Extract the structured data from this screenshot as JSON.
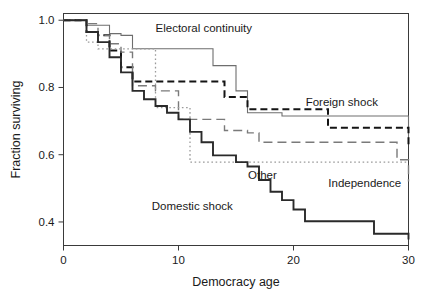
{
  "chart_data": {
    "type": "line",
    "title": "",
    "xlabel": "Democracy age",
    "ylabel": "Fraction surviving",
    "xlim": [
      0,
      30
    ],
    "ylim": [
      0.33,
      1.02
    ],
    "xticks": [
      0,
      10,
      20,
      30
    ],
    "xtick_labels": [
      "0",
      "10",
      "20",
      "30"
    ],
    "yticks": [
      0.4,
      0.6,
      0.8,
      1.0
    ],
    "ytick_labels": [
      "0.4",
      "0.6",
      "0.8",
      "1.0"
    ],
    "grid": false,
    "legend": "inline-annotations",
    "step_type": "post",
    "series": [
      {
        "name": "Electoral continuity",
        "style": "solid-thin",
        "color": "#6e6e6e",
        "label_x": 12.2,
        "label_y": 0.965,
        "x": [
          0,
          1,
          2,
          3,
          4,
          5,
          6,
          11,
          13,
          15,
          16,
          19,
          30
        ],
        "y": [
          1.0,
          1.0,
          0.985,
          0.985,
          0.96,
          0.955,
          0.915,
          0.915,
          0.865,
          0.79,
          0.725,
          0.715,
          0.645
        ]
      },
      {
        "name": "Foreign shock",
        "style": "dashed-bold",
        "color": "#141414",
        "label_x": 24.2,
        "label_y": 0.745,
        "x": [
          0,
          1,
          2,
          3,
          4,
          5,
          6,
          13,
          14,
          16,
          19,
          23,
          30
        ],
        "y": [
          1.0,
          1.0,
          0.965,
          0.955,
          0.91,
          0.86,
          0.818,
          0.818,
          0.772,
          0.735,
          0.735,
          0.68,
          0.63
        ]
      },
      {
        "name": "Independence",
        "style": "dashed-long",
        "color": "#7a7a7a",
        "label_x": 26.2,
        "label_y": 0.503,
        "x": [
          0,
          1,
          2,
          3,
          4,
          5,
          6,
          8,
          10,
          13,
          14,
          16,
          17,
          22,
          29,
          30
        ],
        "y": [
          1.0,
          1.0,
          0.99,
          0.955,
          0.93,
          0.905,
          0.805,
          0.79,
          0.705,
          0.705,
          0.672,
          0.665,
          0.637,
          0.637,
          0.585,
          0.52
        ]
      },
      {
        "name": "Other",
        "style": "dotted",
        "color": "#9a9a9a",
        "label_x": 17.3,
        "label_y": 0.528,
        "x": [
          0,
          1,
          2,
          3,
          6,
          8,
          10,
          11,
          30
        ],
        "y": [
          1.0,
          1.0,
          0.935,
          0.915,
          0.915,
          0.74,
          0.74,
          0.578,
          0.578
        ]
      },
      {
        "name": "Domestic shock",
        "style": "solid-bold",
        "color": "#2a2a2a",
        "label_x": 11.2,
        "label_y": 0.437,
        "x": [
          0,
          1,
          2,
          3,
          4,
          5,
          6,
          7,
          8,
          9,
          10,
          11,
          12,
          13,
          14,
          15,
          16,
          17,
          18,
          19,
          20,
          21,
          27,
          30
        ],
        "y": [
          1.0,
          1.0,
          0.965,
          0.935,
          0.89,
          0.845,
          0.79,
          0.765,
          0.745,
          0.725,
          0.705,
          0.668,
          0.637,
          0.598,
          0.598,
          0.578,
          0.565,
          0.525,
          0.49,
          0.465,
          0.437,
          0.402,
          0.365,
          0.348
        ]
      }
    ]
  },
  "axes": {
    "x_title": "Democracy age",
    "y_title": "Fraction surviving"
  }
}
